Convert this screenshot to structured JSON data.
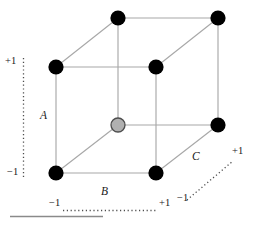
{
  "figure": {
    "colors": {
      "edge": "#a8a8a8",
      "point_filled": "#000000",
      "point_open": "#b0b0b0",
      "point_open_stroke": "#4d4d4d",
      "axis_dotted": "#4d4d4d",
      "rule": "#808080",
      "text": "#1a1a1a"
    },
    "axes": [
      {
        "id": "A",
        "name": "A",
        "orientation": "vertical-left",
        "low_label": "−1",
        "high_label": "+1"
      },
      {
        "id": "B",
        "name": "B",
        "orientation": "horizontal-bottom",
        "low_label": "−1",
        "high_label": "+1"
      },
      {
        "id": "C",
        "name": "C",
        "orientation": "diagonal-depth",
        "low_label": "−1",
        "high_label": "+1"
      }
    ],
    "vertices": [
      {
        "id": "v-back-top-left",
        "A": "+1",
        "B": "−1",
        "C": "+1",
        "x": 118,
        "y": 18,
        "marker": "filled",
        "r": 7.5
      },
      {
        "id": "v-back-top-right",
        "A": "+1",
        "B": "+1",
        "C": "+1",
        "x": 218,
        "y": 18,
        "marker": "filled",
        "r": 7.5
      },
      {
        "id": "v-front-top-left",
        "A": "+1",
        "B": "−1",
        "C": "−1",
        "x": 56,
        "y": 67,
        "marker": "filled",
        "r": 7.5
      },
      {
        "id": "v-front-top-right",
        "A": "+1",
        "B": "+1",
        "C": "−1",
        "x": 156,
        "y": 67,
        "marker": "filled",
        "r": 7.5
      },
      {
        "id": "v-back-bottom-left",
        "A": "−1",
        "B": "−1",
        "C": "+1",
        "x": 118,
        "y": 125,
        "marker": "open",
        "r": 7.0
      },
      {
        "id": "v-back-bottom-right",
        "A": "−1",
        "B": "+1",
        "C": "+1",
        "x": 218,
        "y": 125,
        "marker": "filled",
        "r": 7.5
      },
      {
        "id": "v-front-bottom-left",
        "A": "−1",
        "B": "−1",
        "C": "−1",
        "x": 56,
        "y": 173,
        "marker": "filled",
        "r": 7.5
      },
      {
        "id": "v-front-bottom-right",
        "A": "−1",
        "B": "+1",
        "C": "−1",
        "x": 156,
        "y": 173,
        "marker": "filled",
        "r": 7.5
      }
    ],
    "labels": {
      "axis_a": "A",
      "axis_b": "B",
      "axis_c": "C",
      "a_high": "+1",
      "a_low": "−1",
      "b_low": "−1",
      "b_high": "+1",
      "c_low": "−1",
      "c_high": "+1"
    }
  }
}
